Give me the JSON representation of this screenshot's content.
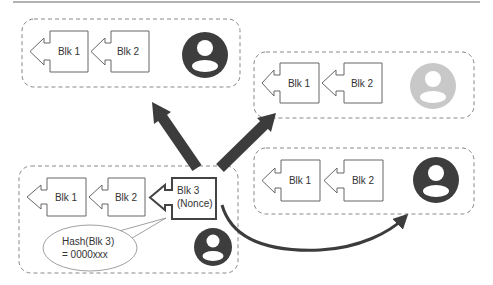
{
  "colors": {
    "stroke": "#666666",
    "dashed": "#888888",
    "arrow": "#3c3c3c",
    "avatar_dark": "#3d3d3d",
    "avatar_light": "#c8c8c8",
    "background": "#ffffff"
  },
  "nodes": {
    "top_left": {
      "blocks": [
        {
          "label": "Blk 1"
        },
        {
          "label": "Blk 2"
        }
      ],
      "avatar": "user-dark"
    },
    "top_right": {
      "blocks": [
        {
          "label": "Blk 1"
        },
        {
          "label": "Blk 2"
        }
      ],
      "avatar": "user-light"
    },
    "bottom_left": {
      "blocks": [
        {
          "label": "Blk 1"
        },
        {
          "label": "Blk 2"
        },
        {
          "label_line1": "Blk 3",
          "label_line2": "(Nonce)"
        }
      ],
      "callout": {
        "line1": "Hash(Blk 3)",
        "line2": "= 0000xxx"
      },
      "avatar": "user-dark"
    },
    "bottom_right": {
      "blocks": [
        {
          "label": "Blk 1"
        },
        {
          "label": "Blk 2"
        }
      ],
      "avatar": "user-dark"
    }
  },
  "edges": [
    {
      "from": "bottom_left",
      "to": "top_left",
      "style": "thick-straight"
    },
    {
      "from": "bottom_left",
      "to": "top_right",
      "style": "thick-straight"
    },
    {
      "from": "bottom_left",
      "to": "bottom_right",
      "style": "curved"
    }
  ]
}
